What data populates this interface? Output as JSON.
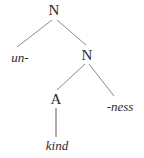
{
  "figure": {
    "type": "morphological-tree",
    "background_color": "#ffffff",
    "line_color": "#8a8a8a",
    "text_color": "#2b2b2b",
    "width": 144,
    "height": 158
  },
  "nodes": [
    {
      "id": "root-n",
      "label": "N",
      "kind": "category",
      "x": 54,
      "y": 3
    },
    {
      "id": "prefix-un",
      "label": "un-",
      "kind": "morpheme",
      "x": 20,
      "y": 51
    },
    {
      "id": "inner-n",
      "label": "N",
      "kind": "category",
      "x": 87,
      "y": 48
    },
    {
      "id": "adj-a",
      "label": "A",
      "kind": "category",
      "x": 56,
      "y": 92
    },
    {
      "id": "suffix-ness",
      "label": "-ness",
      "kind": "morpheme",
      "x": 120,
      "y": 100
    },
    {
      "id": "root-kind",
      "label": "kind",
      "kind": "morpheme",
      "x": 57,
      "y": 139
    }
  ],
  "branches": [
    {
      "id": "root-to-un",
      "from": "root-n",
      "to": "prefix-un",
      "x1": 52,
      "y1": 20,
      "x2": 17,
      "y2": 47
    },
    {
      "id": "root-to-innern",
      "from": "root-n",
      "to": "inner-n",
      "x1": 57,
      "y1": 20,
      "x2": 86,
      "y2": 45
    },
    {
      "id": "innern-to-a",
      "from": "inner-n",
      "to": "adj-a",
      "x1": 85,
      "y1": 64,
      "x2": 57,
      "y2": 90
    },
    {
      "id": "innern-to-ness",
      "from": "inner-n",
      "to": "suffix-ness",
      "x1": 89,
      "y1": 64,
      "x2": 114,
      "y2": 96
    },
    {
      "id": "a-to-kind",
      "from": "adj-a",
      "to": "root-kind",
      "x1": 56,
      "y1": 108,
      "x2": 56,
      "y2": 137
    }
  ]
}
